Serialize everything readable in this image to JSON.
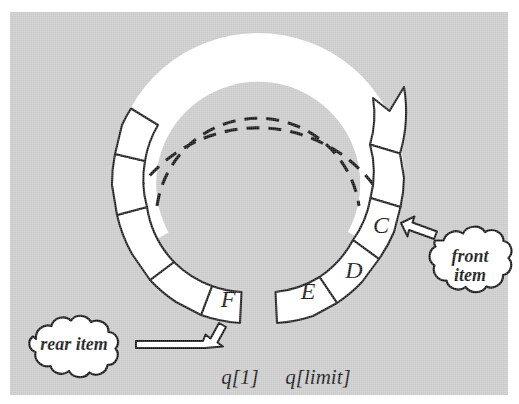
{
  "figure": {
    "background_color": "#c9c9c9",
    "ink_color": "#111111",
    "cell_fill": "#ffffff"
  },
  "ring": {
    "center": {
      "x": 258,
      "y": 178
    },
    "outer_radius": 146,
    "inner_radius": 102,
    "dashed_arc_note": "dashed",
    "cells": [
      {
        "label": "C",
        "angle_deg": -30,
        "filled": true
      },
      {
        "label": "D",
        "angle_deg": 14,
        "filled": true
      },
      {
        "label": "E",
        "angle_deg": 55,
        "filled": true
      },
      {
        "label": "",
        "angle_deg": 125,
        "filled": false
      },
      {
        "label": "F",
        "angle_deg": 95,
        "filled": true
      },
      {
        "label": "",
        "angle_deg": 160,
        "filled": false
      },
      {
        "label": "",
        "angle_deg": 196,
        "filled": false
      },
      {
        "label": "",
        "angle_deg": 232,
        "filled": false
      }
    ]
  },
  "cell_labels": {
    "c": "C",
    "d": "D",
    "e": "E",
    "f": "F"
  },
  "callouts": {
    "front": {
      "line1": "front",
      "line2": "item",
      "target": "C"
    },
    "rear": {
      "line1": "rear item",
      "target": "F"
    }
  },
  "axis_labels": {
    "left": "q[1]",
    "right": "q[limit]"
  }
}
